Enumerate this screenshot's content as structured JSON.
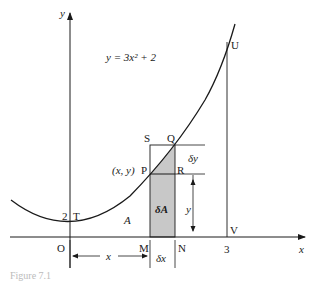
{
  "figure": {
    "equation": "y = 3x² + 2",
    "axis_labels": {
      "x": "x",
      "y": "y"
    },
    "points": {
      "origin": "O",
      "T": "T",
      "T_value": "2",
      "S": "S",
      "Q": "Q",
      "P": "P",
      "P_coords": "(x, y)",
      "R": "R",
      "M": "M",
      "N": "N",
      "U": "U",
      "V": "V",
      "x_tick_3": "3"
    },
    "region_labels": {
      "area": "A",
      "strip_area": "δA"
    },
    "dimension_labels": {
      "dx": "δx",
      "dy": "δy",
      "height": "y",
      "width": "x"
    },
    "caption": "Figure 7.1",
    "colors": {
      "ink": "#1a1a1a",
      "strip_fill": "#c8c8c8"
    }
  }
}
